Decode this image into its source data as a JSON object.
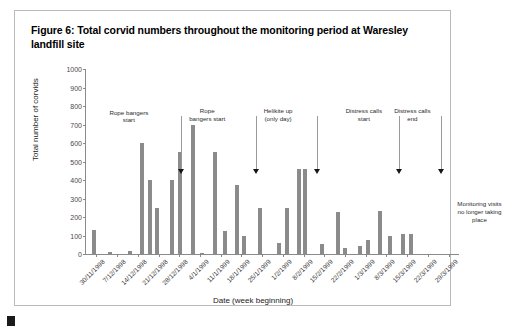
{
  "figure": {
    "caption": "Figure 6: Total corvid numbers throughout the monitoring period at Waresley landfill site"
  },
  "chart_data": {
    "type": "bar",
    "title": "Figure 6: Total corvid numbers throughout the monitoring period at Waresley landfill site",
    "xlabel": "Date (week beginning)",
    "ylabel": "Total number of corvids",
    "ylim": [
      0,
      1000
    ],
    "ytick_labels": [
      "1000",
      "900",
      "800",
      "700",
      "600",
      "500",
      "400",
      "300",
      "200",
      "100",
      "0"
    ],
    "ytick_values": [
      1000,
      900,
      800,
      700,
      600,
      500,
      400,
      300,
      200,
      100,
      0
    ],
    "grid": false,
    "legend": "none",
    "bar_color": "#8b8b8b",
    "categories": [
      "30/11/1998",
      "7/12/1998",
      "14/12/1998",
      "21/12/1998",
      "28/12/1998",
      "4/1/1999",
      "11/1/1999",
      "18/1/1999",
      "25/1/1999",
      "1/2/1999",
      "8/2/1999",
      "15/2/1999",
      "22/2/1999",
      "1/3/1999",
      "8/3/1999",
      "15/3/1999",
      "22/3/1999",
      "29/3/1999"
    ],
    "bars": [
      {
        "x": 0.3,
        "value": 130
      },
      {
        "x": 1.05,
        "value": 10
      },
      {
        "x": 2.05,
        "value": 18
      },
      {
        "x": 2.6,
        "value": 600
      },
      {
        "x": 3.0,
        "value": 400
      },
      {
        "x": 3.35,
        "value": 250
      },
      {
        "x": 4.05,
        "value": 400
      },
      {
        "x": 4.45,
        "value": 550
      },
      {
        "x": 5.05,
        "value": 700
      },
      {
        "x": 5.5,
        "value": 8
      },
      {
        "x": 6.15,
        "value": 550
      },
      {
        "x": 6.6,
        "value": 125
      },
      {
        "x": 7.2,
        "value": 375
      },
      {
        "x": 7.55,
        "value": 100
      },
      {
        "x": 8.3,
        "value": 250
      },
      {
        "x": 9.2,
        "value": 60
      },
      {
        "x": 9.6,
        "value": 250
      },
      {
        "x": 10.2,
        "value": 460
      },
      {
        "x": 10.45,
        "value": 460
      },
      {
        "x": 11.3,
        "value": 55
      },
      {
        "x": 12.05,
        "value": 225
      },
      {
        "x": 12.4,
        "value": 30
      },
      {
        "x": 13.15,
        "value": 45
      },
      {
        "x": 13.5,
        "value": 75
      },
      {
        "x": 14.1,
        "value": 230
      },
      {
        "x": 14.55,
        "value": 100
      },
      {
        "x": 15.2,
        "value": 110
      },
      {
        "x": 15.6,
        "value": 110
      }
    ],
    "annotations": [
      {
        "label": "Rope bangers\nstart",
        "text_x": 0.115,
        "text_y": 0.215,
        "leader_x": 0.255,
        "leader_top": 0.255,
        "leader_bottom": 0.565
      },
      {
        "label": "Rope\nbangers start",
        "text_x": 0.325,
        "text_y": 0.205,
        "leader_x": 0.455,
        "leader_top": 0.255,
        "leader_bottom": 0.565
      },
      {
        "label": "Helikite up\n(only day)",
        "text_x": 0.515,
        "text_y": 0.205,
        "leader_x": 0.618,
        "leader_top": 0.255,
        "leader_bottom": 0.565
      },
      {
        "label": "Distress calls\nstart",
        "text_x": 0.745,
        "text_y": 0.205,
        "leader_x": 0.838,
        "leader_top": 0.255,
        "leader_bottom": 0.565
      },
      {
        "label": "Distress calls\nend",
        "text_x": 0.875,
        "text_y": 0.205,
        "leader_x": 0.952,
        "leader_top": 0.255,
        "leader_bottom": 0.565
      }
    ],
    "notes": [
      {
        "text": "Monitoring visits\nno longer taking\nplace",
        "x": 1.055,
        "y": 0.71
      }
    ]
  }
}
